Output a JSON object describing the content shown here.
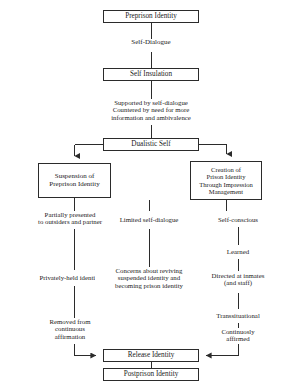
{
  "diagram": {
    "width": 292,
    "height": 385,
    "line_color": "#2b2b2b",
    "background": "#ffffff",
    "nodes": [
      {
        "id": "preprison-identity",
        "label": "Preprison Identity",
        "x": 103,
        "y": 10,
        "w": 96,
        "h": 13,
        "font_size": 7.2
      },
      {
        "id": "self-insulation",
        "label": "Self Insulation",
        "x": 103,
        "y": 68,
        "w": 96,
        "h": 13,
        "font_size": 7.2
      },
      {
        "id": "dualistic-self",
        "label": "Dualistic Self",
        "x": 103,
        "y": 138,
        "w": 96,
        "h": 13,
        "font_size": 7.2
      },
      {
        "id": "suspension-of-preprison-identity",
        "label": "Suspension of\nPreprison Identity",
        "x": 38,
        "y": 163,
        "w": 73,
        "h": 35,
        "font_size": 7.0
      },
      {
        "id": "creation-of-prison-identity",
        "label": "Creation of\nPrison Identity\nThrough Impression\nManagement",
        "x": 190,
        "y": 161,
        "w": 72,
        "h": 39,
        "font_size": 6.6
      },
      {
        "id": "release-identity",
        "label": "Release Identity",
        "x": 103,
        "y": 349,
        "w": 96,
        "h": 13,
        "font_size": 7.2
      },
      {
        "id": "postprison-identity",
        "label": "Postprison Identity",
        "x": 103,
        "y": 368,
        "w": 96,
        "h": 13,
        "font_size": 7.2
      }
    ],
    "edge_labels": [
      {
        "id": "self-dialogue",
        "text": "Self-Dialogue",
        "cx": 151,
        "cy": 45,
        "w": 64,
        "font_size": 7.0
      },
      {
        "id": "supported-countered",
        "text": "Supported by self-dialogue\nCountered by need for more\ninformation and ambivalence",
        "cx": 151,
        "cy": 112,
        "w": 124,
        "font_size": 6.8
      },
      {
        "id": "partially-presented",
        "text": "Partially presented\nto outsiders and partner",
        "cx": 70,
        "cy": 220,
        "w": 98,
        "font_size": 6.8
      },
      {
        "id": "limited-self-dialogue",
        "text": "Limited self-dialogue",
        "cx": 149,
        "cy": 220,
        "w": 88,
        "font_size": 6.8
      },
      {
        "id": "self-conscious",
        "text": "Self-conscious",
        "cx": 238,
        "cy": 220,
        "w": 66,
        "font_size": 6.8
      },
      {
        "id": "learned",
        "text": "Learned",
        "cx": 238,
        "cy": 252,
        "w": 52,
        "font_size": 6.8
      },
      {
        "id": "privately-held-identity",
        "text": "Privately-held identity",
        "cx": 70,
        "cy": 278,
        "w": 90,
        "font_size": 6.8
      },
      {
        "id": "concerns-about-reviving",
        "text": "Concerns about reviving\nsuspended identity and\nbecoming prison identity",
        "cx": 149,
        "cy": 281,
        "w": 108,
        "font_size": 6.8
      },
      {
        "id": "directed-at-inmates",
        "text": "Directed at inmates\n(and staff)",
        "cx": 238,
        "cy": 281,
        "w": 84,
        "font_size": 6.8
      },
      {
        "id": "transsituational",
        "text": "Transsituational",
        "cx": 238,
        "cy": 316,
        "w": 70,
        "font_size": 6.8
      },
      {
        "id": "removed-from-continuous-affirmation",
        "text": "Removed from\ncontinuous\naffirmation",
        "cx": 70,
        "cy": 329,
        "w": 72,
        "font_size": 6.8
      },
      {
        "id": "continuosly-affirmed",
        "text": "Continuosly\naffirmed",
        "cx": 238,
        "cy": 336,
        "w": 62,
        "font_size": 6.8
      }
    ]
  }
}
